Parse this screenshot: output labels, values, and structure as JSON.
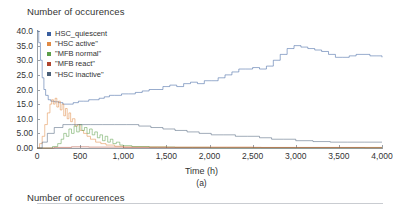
{
  "panel_a": {
    "title": "Number of occurences",
    "caption": "(a)",
    "xlabel": "Time (h)"
  },
  "panel_b": {
    "title": "Number of occurences"
  },
  "legend": {
    "items": [
      {
        "label": "HSC_quiescent",
        "color": "#3a5fa0"
      },
      {
        "label": "\"HSC active\"",
        "color": "#e08a45"
      },
      {
        "label": "\"MFB normal\"",
        "color": "#5c9f4a"
      },
      {
        "label": "\"MFB react\"",
        "color": "#b0452f"
      },
      {
        "label": "\"HSC inactive\"",
        "color": "#4a5f78"
      }
    ]
  },
  "chart_data": {
    "type": "line",
    "title": "Number of occurences",
    "xlabel": "Time (h)",
    "ylabel": "Number of occurences",
    "xlim": [
      0,
      4000
    ],
    "ylim": [
      0,
      40
    ],
    "xticks": [
      0,
      500,
      1000,
      1500,
      2000,
      2500,
      3000,
      3500,
      4000
    ],
    "xtick_labels": [
      "0",
      "500",
      "1,000",
      "1,500",
      "2,000",
      "2,500",
      "3,000",
      "3,500",
      "4,000"
    ],
    "yticks": [
      0,
      5,
      10,
      15,
      20,
      25,
      30,
      35,
      40
    ],
    "ytick_labels": [
      "0.00",
      "5.00",
      "10.0",
      "15.0",
      "20.0",
      "25.0",
      "30.0",
      "35.0",
      "40.0"
    ],
    "grid": false,
    "legend_position": "upper-left",
    "series": [
      {
        "name": "HSC_quiescent",
        "color": "#3a5fa0",
        "x": [
          0,
          20,
          40,
          60,
          80,
          100,
          130,
          160,
          200,
          250,
          300,
          360,
          420,
          480,
          540,
          600,
          660,
          720,
          780,
          840,
          900,
          980,
          1060,
          1140,
          1220,
          1300,
          1380,
          1460,
          1540,
          1620,
          1700,
          1780,
          1860,
          1940,
          2020,
          2100,
          2180,
          2260,
          2340,
          2420,
          2500,
          2580,
          2660,
          2740,
          2820,
          2900,
          2980,
          3060,
          3140,
          3220,
          3300,
          3380,
          3460,
          3540,
          3620,
          3700,
          3780,
          3860,
          3940,
          4000
        ],
        "y": [
          40.0,
          36.0,
          30.0,
          24.0,
          20.0,
          18.0,
          16.5,
          16.0,
          15.8,
          15.5,
          15.0,
          15.0,
          15.5,
          16.0,
          16.0,
          16.5,
          16.5,
          17.0,
          17.5,
          18.0,
          18.0,
          18.5,
          18.5,
          19.0,
          19.5,
          20.0,
          20.0,
          21.0,
          21.5,
          21.0,
          22.0,
          22.5,
          22.0,
          23.0,
          23.0,
          24.0,
          25.0,
          26.0,
          27.0,
          27.0,
          27.5,
          27.0,
          28.0,
          30.0,
          32.0,
          34.0,
          35.0,
          34.5,
          34.0,
          33.5,
          33.0,
          32.0,
          31.0,
          31.0,
          31.5,
          32.0,
          32.0,
          31.5,
          31.5,
          31.0
        ]
      },
      {
        "name": "\"HSC active\"",
        "color": "#e08a45",
        "x": [
          0,
          30,
          60,
          90,
          120,
          150,
          170,
          190,
          210,
          230,
          250,
          270,
          290,
          310,
          330,
          350,
          370,
          390,
          410,
          440,
          470,
          500,
          540,
          580,
          620,
          680,
          740,
          800,
          900,
          1000,
          1500,
          2000,
          2500,
          3000,
          3500,
          4000
        ],
        "y": [
          0,
          1.5,
          4.0,
          8.0,
          12.0,
          15.0,
          16.5,
          15.0,
          17.0,
          14.0,
          16.0,
          13.0,
          15.0,
          11.0,
          13.5,
          10.0,
          12.0,
          9.0,
          10.0,
          7.5,
          8.0,
          6.0,
          5.0,
          4.0,
          3.0,
          2.0,
          1.5,
          1.0,
          0.6,
          0.4,
          0.3,
          0.3,
          0.2,
          0.2,
          0.2,
          0.2
        ]
      },
      {
        "name": "\"MFB normal\"",
        "color": "#5c9f4a",
        "x": [
          0,
          100,
          180,
          240,
          280,
          310,
          340,
          370,
          400,
          430,
          460,
          490,
          520,
          550,
          580,
          610,
          640,
          670,
          700,
          730,
          760,
          790,
          820,
          850,
          880,
          920,
          960,
          1000,
          1100,
          1300,
          1600,
          2000,
          3000,
          4000
        ],
        "y": [
          0,
          0,
          0.5,
          1.5,
          3.0,
          5.0,
          4.0,
          6.5,
          5.0,
          7.5,
          5.5,
          8.0,
          6.0,
          7.0,
          5.0,
          6.5,
          4.5,
          5.5,
          3.5,
          4.5,
          2.5,
          4.0,
          2.0,
          3.0,
          1.5,
          2.0,
          1.0,
          0.8,
          0.5,
          0.3,
          0.2,
          0.1,
          0.1,
          0.1
        ]
      },
      {
        "name": "\"MFB react\"",
        "color": "#b0452f",
        "x": [
          0,
          200,
          400,
          600,
          800,
          1000,
          1400,
          1800,
          2200,
          2600,
          3000,
          3400,
          3800,
          4000
        ],
        "y": [
          0,
          0.2,
          0.4,
          0.3,
          0.3,
          0.2,
          0.2,
          0.2,
          0.2,
          0.15,
          0.15,
          0.15,
          0.1,
          0.1
        ]
      },
      {
        "name": "\"HSC inactive\"",
        "color": "#4a5f78",
        "x": [
          0,
          60,
          120,
          200,
          300,
          400,
          500,
          620,
          760,
          900,
          1040,
          1180,
          1320,
          1460,
          1600,
          1740,
          1880,
          2020,
          2160,
          2300,
          2440,
          2580,
          2720,
          2860,
          3000,
          3200,
          3400,
          3600,
          3800,
          4000
        ],
        "y": [
          0,
          2.0,
          5.0,
          7.0,
          8.0,
          8.0,
          8.0,
          8.0,
          8.0,
          8.0,
          8.0,
          7.5,
          7.0,
          6.5,
          6.0,
          5.5,
          5.0,
          4.5,
          4.5,
          4.0,
          4.0,
          3.5,
          3.0,
          3.0,
          2.5,
          2.2,
          2.0,
          2.0,
          2.0,
          2.0
        ]
      }
    ]
  }
}
